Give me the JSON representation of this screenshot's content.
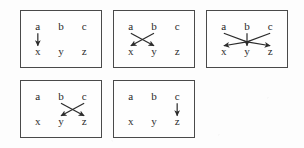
{
  "figure": {
    "background_color": "#fdfdfd",
    "border_color": "#4a4a4a",
    "ink_color": "#2b2b2b",
    "top_row_labels": [
      "a",
      "b",
      "c"
    ],
    "bottom_row_labels": [
      "x",
      "y",
      "z"
    ],
    "panels": [
      {
        "id": "panel-1",
        "row": 1,
        "column": 1,
        "box": {
          "left": 20,
          "top": 10,
          "width": 82,
          "height": 58
        },
        "top_nodes": [
          "a",
          "b",
          "c"
        ],
        "bottom_nodes": [
          "x",
          "y",
          "z"
        ],
        "arrows": [
          {
            "from": "a",
            "to": "x"
          }
        ],
        "arrow_count": 1,
        "crossings": 0
      },
      {
        "id": "panel-2",
        "row": 1,
        "column": 2,
        "box": {
          "left": 113,
          "top": 10,
          "width": 82,
          "height": 58
        },
        "top_nodes": [
          "a",
          "b",
          "c"
        ],
        "bottom_nodes": [
          "x",
          "y",
          "z"
        ],
        "arrows": [
          {
            "from": "a",
            "to": "y"
          },
          {
            "from": "b",
            "to": "x"
          }
        ],
        "arrow_count": 2,
        "crossings": 1
      },
      {
        "id": "panel-3",
        "row": 1,
        "column": 3,
        "box": {
          "left": 206,
          "top": 10,
          "width": 82,
          "height": 58
        },
        "top_nodes": [
          "a",
          "b",
          "c"
        ],
        "bottom_nodes": [
          "x",
          "y",
          "z"
        ],
        "arrows": [
          {
            "from": "a",
            "to": "z"
          },
          {
            "from": "b",
            "to": "y"
          },
          {
            "from": "c",
            "to": "x"
          }
        ],
        "arrow_count": 3,
        "crossings": 3
      },
      {
        "id": "panel-4",
        "row": 2,
        "column": 1,
        "box": {
          "left": 20,
          "top": 80,
          "width": 82,
          "height": 58
        },
        "top_nodes": [
          "a",
          "b",
          "c"
        ],
        "bottom_nodes": [
          "x",
          "y",
          "z"
        ],
        "arrows": [
          {
            "from": "b",
            "to": "z"
          },
          {
            "from": "c",
            "to": "y"
          }
        ],
        "arrow_count": 2,
        "crossings": 1
      },
      {
        "id": "panel-5",
        "row": 2,
        "column": 2,
        "box": {
          "left": 113,
          "top": 80,
          "width": 82,
          "height": 58
        },
        "top_nodes": [
          "a",
          "b",
          "c"
        ],
        "bottom_nodes": [
          "x",
          "y",
          "z"
        ],
        "arrows": [
          {
            "from": "c",
            "to": "z"
          }
        ],
        "arrow_count": 1,
        "crossings": 0
      }
    ]
  }
}
